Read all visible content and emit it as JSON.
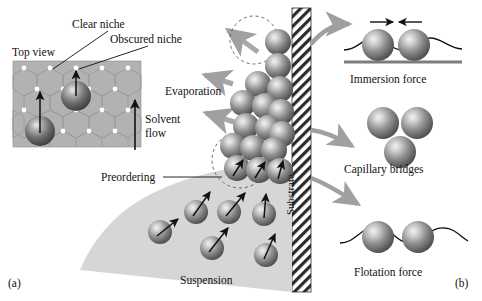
{
  "figure": {
    "panel_a_label": "(a)",
    "panel_b_label": "(b)"
  },
  "inset": {
    "title": "Top view",
    "clear_niche_label": "Clear niche",
    "obscured_niche_label": "Obscured niche",
    "niche_dot_count": 12,
    "sphere_count": 2
  },
  "center": {
    "evaporation_label": "Evaporation",
    "solvent_flow_line1": "Solvent",
    "solvent_flow_line2": "flow",
    "preordering_label": "Preordering",
    "suspension_label": "Suspension",
    "substrate_label": "Substrate",
    "evaporation_arrow_count": 3,
    "crystal_sphere_count": 14,
    "suspension_sphere_count": 10
  },
  "panel_b": {
    "items": [
      {
        "label": "Immersion force",
        "sphere_count": 2,
        "has_meniscus": true,
        "has_baseline": true,
        "has_opposing_arrows": true
      },
      {
        "label": "Capillary bridges",
        "sphere_count": 3,
        "has_meniscus": false,
        "has_baseline": false,
        "has_opposing_arrows": false
      },
      {
        "label": "Flotation force",
        "sphere_count": 2,
        "has_meniscus": true,
        "has_baseline": false,
        "has_opposing_arrows": false
      }
    ],
    "connector_arrow_count": 3
  },
  "colors": {
    "sphere_dark": "#5e5e5e",
    "sphere_light": "#e8e8e8",
    "suspension_fill": "#d4d4d4",
    "inset_fill": "#b0b0b0",
    "gray_arrow": "#a8a8a8",
    "ink": "#111111",
    "baseline": "#808080"
  }
}
